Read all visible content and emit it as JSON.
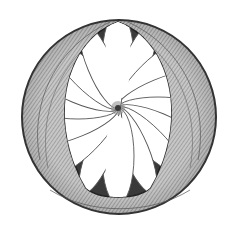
{
  "image": {
    "subject": "pencil sketch of a circular rosette with sixteen petals inside a shaded ring",
    "width": 235,
    "height": 230,
    "colors": {
      "background": "#ffffff",
      "ink_dark": "#2a2a2a",
      "ink_mid": "#6e6e6e",
      "ink_light": "#b8b8b8",
      "petal_fill": "#ffffff"
    },
    "ring": {
      "cx": 119,
      "cy": 117,
      "r": 97
    },
    "lens_opening": {
      "top_y": 22,
      "bottom_y": 200,
      "left_x": 56,
      "right_x": 183
    },
    "rosette": {
      "cx": 118,
      "cy": 108,
      "petal_count": 16
    }
  }
}
